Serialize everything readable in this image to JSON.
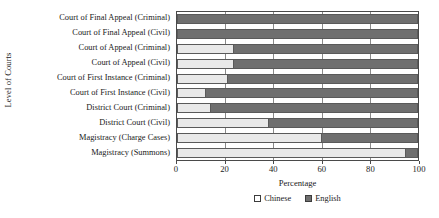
{
  "chart_data": {
    "type": "bar",
    "orientation": "horizontal",
    "stacked": true,
    "stack_total": 100,
    "title": "",
    "xlabel": "Percentage",
    "ylabel": "Level of Courts",
    "xlim": [
      0,
      100
    ],
    "xticks": [
      0,
      20,
      40,
      60,
      80,
      100
    ],
    "xtick_labels": [
      "0",
      "20",
      "40",
      "60",
      "80",
      "100"
    ],
    "grid": true,
    "legend_position": "bottom-center",
    "categories": [
      "Court of Final Appeal (Criminal)",
      "Court of Final Appeal (Civil)",
      "Court of Appeal (Criminal)",
      "Court of Appeal (Civil)",
      "Court of First Instance (Criminal)",
      "Court of First Instance (Civil)",
      "District Court (Criminal)",
      "District Court (Civil)",
      "Magistracy (Charge Cases)",
      "Magistracy (Summons)"
    ],
    "series": [
      {
        "name": "Chinese",
        "color": "#e9e9e9",
        "values": [
          0,
          0,
          23.5,
          23.5,
          21,
          12,
          14,
          38,
          60,
          95
        ]
      },
      {
        "name": "English",
        "color": "#6f6f6f",
        "values": [
          100,
          100,
          76.5,
          76.5,
          79,
          88,
          86,
          62,
          40,
          5
        ]
      }
    ],
    "legend": [
      "Chinese",
      "English"
    ]
  },
  "axes": {
    "y_title": "Level of Courts",
    "x_title": "Percentage"
  }
}
